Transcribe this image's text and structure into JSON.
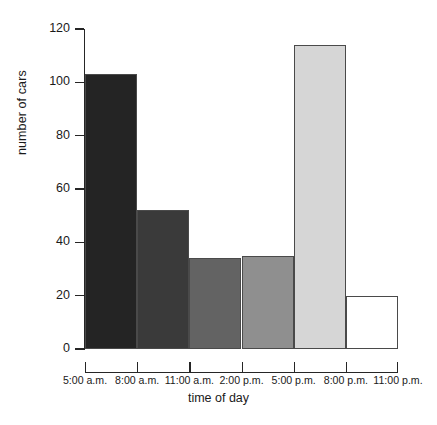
{
  "chart_data": {
    "type": "bar",
    "title": "",
    "xlabel": "time of day",
    "ylabel": "number of cars",
    "categories": [
      "5:00 a.m. - 8:00 a.m.",
      "8:00 a.m. - 11:00 a.m.",
      "11:00 a.m. - 2:00 p.m.",
      "2:00 p.m. - 5:00 p.m.",
      "5:00 p.m. - 8:00 p.m.",
      "8:00 p.m. - 11:00 p.m."
    ],
    "values": [
      103,
      52,
      34,
      35,
      114,
      20
    ],
    "bar_colors": [
      "#242424",
      "#3a3a3a",
      "#636363",
      "#8f8f8f",
      "#d6d6d6",
      "#ffffff"
    ],
    "bar_edge_color": "#4a4a4a",
    "x_tick_labels": [
      "5:00 a.m.",
      "8:00 a.m.",
      "11:00 a.m.",
      "2:00 p.m.",
      "5:00 p.m.",
      "8:00 p.m.",
      "11:00 p.m."
    ],
    "y_tick_labels": [
      "0",
      "20",
      "40",
      "60",
      "80",
      "100",
      "120"
    ],
    "y_tick_values": [
      0,
      20,
      40,
      60,
      80,
      100,
      120
    ],
    "ylim": [
      0,
      120
    ],
    "grid": false,
    "legend": "none"
  }
}
